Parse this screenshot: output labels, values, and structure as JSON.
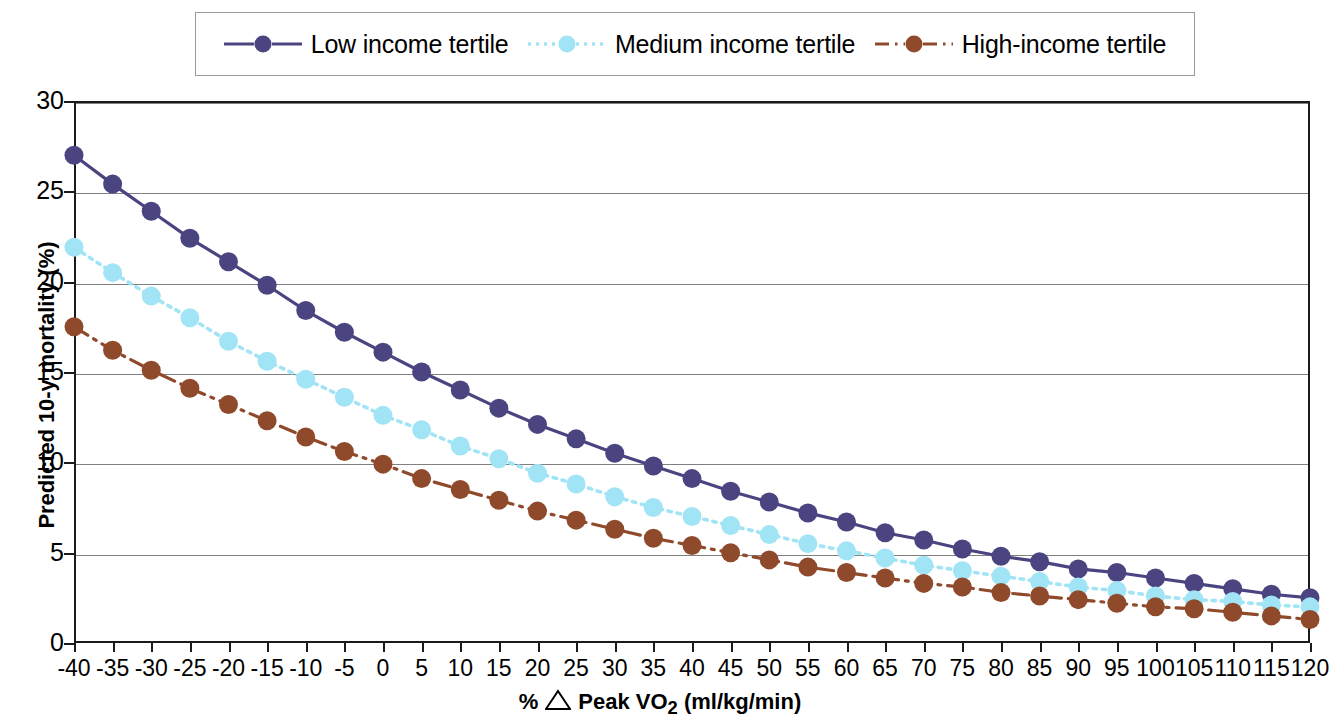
{
  "legend": {
    "position": "top",
    "entries": [
      {
        "label": "Low income tertile",
        "color": "#4a4580",
        "dash": "solid"
      },
      {
        "label": "Medium income tertile",
        "color": "#a0e4f5",
        "dash": "dotted"
      },
      {
        "label": "High-income tertile",
        "color": "#8f4a2c",
        "dash": "dashdot"
      }
    ]
  },
  "axes": {
    "y_title": "Predicted 10-y mortality (%)",
    "x_title_prefix": "%",
    "x_title_symbol": "△",
    "x_title_main": "Peak VO",
    "x_title_sub": "2",
    "x_title_units": "(ml/kg/min)",
    "y_ticks": [
      "0",
      "5",
      "10",
      "15",
      "20",
      "25",
      "30"
    ],
    "y_min": 0,
    "y_max": 30
  },
  "chart_data": {
    "type": "line",
    "title": "",
    "xlabel": "% △ Peak VO2 (ml/kg/min)",
    "ylabel": "Predicted 10-y mortality (%)",
    "xlim": [
      -40,
      120
    ],
    "ylim": [
      0,
      30
    ],
    "grid": true,
    "legend_position": "top",
    "categories": [
      -40,
      -35,
      -30,
      -25,
      -20,
      -15,
      -10,
      -5,
      0,
      5,
      10,
      15,
      20,
      25,
      30,
      35,
      40,
      45,
      50,
      55,
      60,
      65,
      70,
      75,
      80,
      85,
      90,
      95,
      100,
      105,
      110,
      115,
      120
    ],
    "x_tick_labels": [
      "-40",
      "-35",
      "-30",
      "-25",
      "-20",
      "-15",
      "-10",
      "-5",
      "0",
      "5",
      "10",
      "15",
      "20",
      "25",
      "30",
      "35",
      "40",
      "45",
      "50",
      "55",
      "60",
      "65",
      "70",
      "75",
      "80",
      "85",
      "90",
      "95",
      "100",
      "105",
      "110",
      "115",
      "120"
    ],
    "series": [
      {
        "name": "Low income tertile",
        "color": "#4a4580",
        "dash": "solid",
        "values": [
          27.0,
          25.4,
          23.9,
          22.4,
          21.1,
          19.8,
          18.4,
          17.2,
          16.1,
          15.0,
          14.0,
          13.0,
          12.1,
          11.3,
          10.5,
          9.8,
          9.1,
          8.4,
          7.8,
          7.2,
          6.7,
          6.1,
          5.7,
          5.2,
          4.8,
          4.5,
          4.1,
          3.9,
          3.6,
          3.3,
          3.0,
          2.7,
          2.5
        ]
      },
      {
        "name": "Medium income tertile",
        "color": "#a0e4f5",
        "dash": "dotted",
        "values": [
          21.9,
          20.5,
          19.2,
          18.0,
          16.7,
          15.6,
          14.6,
          13.6,
          12.6,
          11.8,
          10.9,
          10.2,
          9.4,
          8.8,
          8.1,
          7.5,
          7.0,
          6.5,
          6.0,
          5.5,
          5.1,
          4.7,
          4.3,
          4.0,
          3.7,
          3.4,
          3.1,
          2.9,
          2.6,
          2.4,
          2.3,
          2.1,
          2.0
        ]
      },
      {
        "name": "High-income tertile",
        "color": "#8f4a2c",
        "dash": "dashdot",
        "values": [
          17.5,
          16.2,
          15.1,
          14.1,
          13.2,
          12.3,
          11.4,
          10.6,
          9.9,
          9.1,
          8.5,
          7.9,
          7.3,
          6.8,
          6.3,
          5.8,
          5.4,
          5.0,
          4.6,
          4.2,
          3.9,
          3.6,
          3.3,
          3.1,
          2.8,
          2.6,
          2.4,
          2.2,
          2.0,
          1.9,
          1.7,
          1.5,
          1.3
        ]
      }
    ]
  }
}
